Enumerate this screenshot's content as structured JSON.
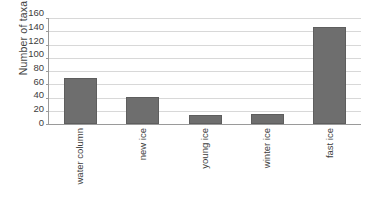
{
  "chart_data": {
    "type": "bar",
    "title": "",
    "subtitle": "",
    "xlabel": "",
    "ylabel": "Number of taxa",
    "categories": [
      "water column",
      "new ice",
      "young ice",
      "winter ice",
      "fast ice"
    ],
    "values": [
      70,
      41,
      14,
      15,
      146
    ],
    "series": [
      {
        "name": "Number of taxa",
        "values": [
          70,
          41,
          14,
          15,
          146
        ]
      }
    ],
    "ylim": [
      0,
      160
    ],
    "ytick_step": 20,
    "yticks": [
      160,
      140,
      120,
      100,
      80,
      60,
      40,
      20,
      0
    ],
    "ytick_labels": [
      "160",
      "140",
      "120",
      "100",
      "80",
      "60",
      "40",
      "20",
      "0"
    ],
    "grid": true,
    "grid_axis": "y",
    "legend": false,
    "legend_position": "none",
    "bar_color": "#6e6e6e",
    "bar_edge_color": "#5e5e5e",
    "gridline_color": "#d8d8d8",
    "axis_color": "#9a9a9a",
    "background_color": "#ffffff",
    "xtick_label_rotation": -90,
    "annotations": []
  }
}
